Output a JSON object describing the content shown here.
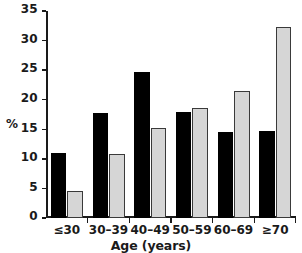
{
  "chart_data": {
    "type": "bar",
    "title": "",
    "xlabel": "Age (years)",
    "ylabel": "%",
    "categories": [
      "≤30",
      "30–39",
      "40–49",
      "50–59",
      "60–69",
      "≥70"
    ],
    "series": [
      {
        "name": "series-dark",
        "color": "#000000",
        "values": [
          11.0,
          17.7,
          24.7,
          18.0,
          14.5,
          14.7
        ]
      },
      {
        "name": "series-light",
        "color": "#d6d6d6",
        "values": [
          4.5,
          10.9,
          15.3,
          18.6,
          21.4,
          32.3
        ]
      }
    ],
    "ylim": [
      0,
      35
    ],
    "yticks": [
      0,
      5,
      10,
      15,
      20,
      25,
      30,
      35
    ],
    "ytick_labels": [
      "0",
      "5",
      "10",
      "15",
      "20",
      "25",
      "30",
      "35"
    ],
    "grid": false,
    "legend": "none"
  }
}
